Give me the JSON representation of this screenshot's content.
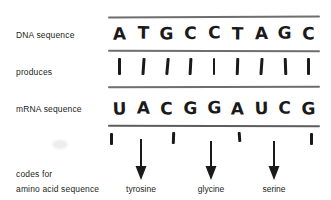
{
  "diagram": {
    "ink_color": "#1a1a1a",
    "rule_color": "#6e6e6e",
    "label_color": "#231f20",
    "background": "#ffffff"
  },
  "labels": {
    "dna": "DNA sequence",
    "produces": "produces",
    "mrna": "mRNA sequence",
    "codes_for": "codes for",
    "amino_acid": "amino acid sequence"
  },
  "dna_sequence": [
    "A",
    "T",
    "G",
    "C",
    "C",
    "T",
    "A",
    "G",
    "C"
  ],
  "mrna_sequence": [
    "U",
    "A",
    "C",
    "G",
    "G",
    "A",
    "U",
    "C",
    "G"
  ],
  "bond_marks": [
    "|",
    "|",
    "|",
    "|",
    "|",
    "|",
    "|",
    "|",
    "|"
  ],
  "codon_ticks": [
    "|",
    "|",
    "|",
    "|"
  ],
  "amino_acids": [
    {
      "name": "tyrosine",
      "codon": "UAC"
    },
    {
      "name": "glycine",
      "codon": "GGA"
    },
    {
      "name": "serine",
      "codon": "UCG"
    }
  ],
  "arrows": [
    "down-arrow",
    "down-arrow",
    "down-arrow"
  ]
}
